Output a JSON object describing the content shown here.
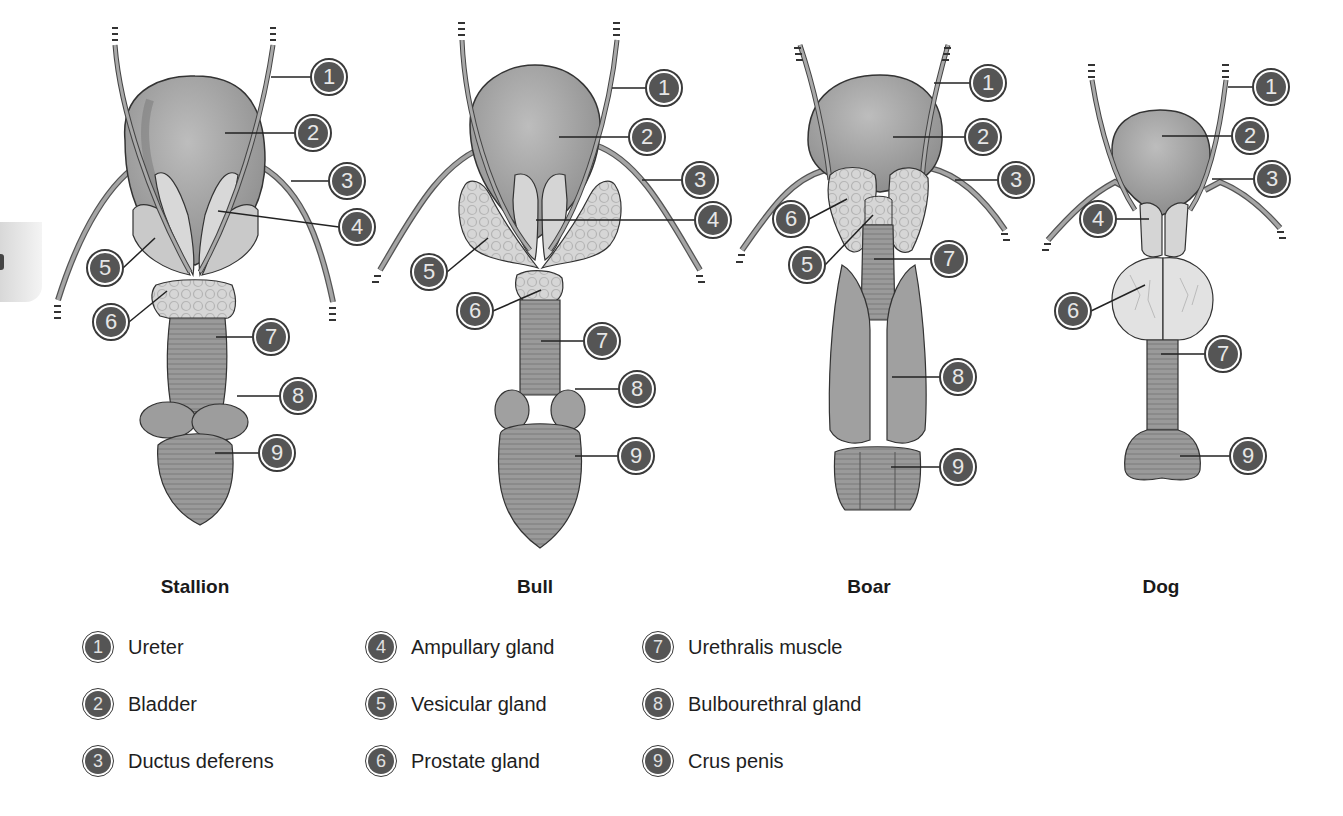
{
  "figure": {
    "species": [
      {
        "name": "Stallion",
        "x": 195
      },
      {
        "name": "Bull",
        "x": 535
      },
      {
        "name": "Boar",
        "x": 869
      },
      {
        "name": "Dog",
        "x": 1161
      }
    ]
  },
  "legend": [
    {
      "number": "1",
      "label": "Ureter"
    },
    {
      "number": "2",
      "label": "Bladder"
    },
    {
      "number": "3",
      "label": "Ductus deferens"
    },
    {
      "number": "4",
      "label": "Ampullary gland"
    },
    {
      "number": "5",
      "label": "Vesicular gland"
    },
    {
      "number": "6",
      "label": "Prostate gland"
    },
    {
      "number": "7",
      "label": "Urethralis muscle"
    },
    {
      "number": "8",
      "label": "Bulbourethral gland"
    },
    {
      "number": "9",
      "label": "Crus penis"
    }
  ],
  "callouts": {
    "stallion": [
      {
        "n": "1",
        "x": 329,
        "y": 77,
        "lx1": 271,
        "ly1": 77
      },
      {
        "n": "2",
        "x": 313,
        "y": 133,
        "lx1": 225,
        "ly1": 133
      },
      {
        "n": "3",
        "x": 347,
        "y": 181,
        "lx1": 291,
        "ly1": 181
      },
      {
        "n": "4",
        "x": 357,
        "y": 227,
        "lx1": 218,
        "ly1": 211
      },
      {
        "n": "5",
        "x": 105,
        "y": 268,
        "lx1": 155,
        "ly1": 238
      },
      {
        "n": "6",
        "x": 111,
        "y": 322,
        "lx1": 167,
        "ly1": 291
      },
      {
        "n": "7",
        "x": 271,
        "y": 337,
        "lx1": 216,
        "ly1": 337
      },
      {
        "n": "8",
        "x": 298,
        "y": 396,
        "lx1": 237,
        "ly1": 396
      },
      {
        "n": "9",
        "x": 277,
        "y": 453,
        "lx1": 215,
        "ly1": 453
      }
    ],
    "bull": [
      {
        "n": "1",
        "x": 664,
        "y": 88,
        "lx1": 612,
        "ly1": 88
      },
      {
        "n": "2",
        "x": 647,
        "y": 137,
        "lx1": 559,
        "ly1": 137
      },
      {
        "n": "3",
        "x": 700,
        "y": 180,
        "lx1": 642,
        "ly1": 180
      },
      {
        "n": "4",
        "x": 713,
        "y": 220,
        "lx1": 536,
        "ly1": 220
      },
      {
        "n": "5",
        "x": 429,
        "y": 272,
        "lx1": 488,
        "ly1": 238
      },
      {
        "n": "6",
        "x": 475,
        "y": 311,
        "lx1": 541,
        "ly1": 290
      },
      {
        "n": "7",
        "x": 602,
        "y": 341,
        "lx1": 541,
        "ly1": 341
      },
      {
        "n": "8",
        "x": 637,
        "y": 389,
        "lx1": 575,
        "ly1": 389
      },
      {
        "n": "9",
        "x": 636,
        "y": 456,
        "lx1": 575,
        "ly1": 456
      }
    ],
    "boar": [
      {
        "n": "1",
        "x": 988,
        "y": 83,
        "lx1": 934,
        "ly1": 83
      },
      {
        "n": "2",
        "x": 983,
        "y": 137,
        "lx1": 893,
        "ly1": 137
      },
      {
        "n": "3",
        "x": 1016,
        "y": 180,
        "lx1": 955,
        "ly1": 180
      },
      {
        "n": "4",
        "x": 0,
        "y": 0,
        "hidden": true
      },
      {
        "n": "5",
        "x": 807,
        "y": 265,
        "lx1": 873,
        "ly1": 215
      },
      {
        "n": "6",
        "x": 791,
        "y": 219,
        "lx1": 847,
        "ly1": 199
      },
      {
        "n": "7",
        "x": 949,
        "y": 259,
        "lx1": 874,
        "ly1": 259
      },
      {
        "n": "8",
        "x": 958,
        "y": 377,
        "lx1": 892,
        "ly1": 377
      },
      {
        "n": "9",
        "x": 958,
        "y": 467,
        "lx1": 891,
        "ly1": 467
      }
    ],
    "dog": [
      {
        "n": "1",
        "x": 1271,
        "y": 87,
        "lx1": 1228,
        "ly1": 87
      },
      {
        "n": "2",
        "x": 1250,
        "y": 136,
        "lx1": 1162,
        "ly1": 136
      },
      {
        "n": "3",
        "x": 1272,
        "y": 179,
        "lx1": 1212,
        "ly1": 179
      },
      {
        "n": "5x",
        "hidden": true,
        "x": 0,
        "y": 0
      },
      {
        "n": "4",
        "x": 1098,
        "y": 219,
        "lx1": 1149,
        "ly1": 219
      },
      {
        "n": "6",
        "x": 1073,
        "y": 311,
        "lx1": 1145,
        "ly1": 285
      },
      {
        "n": "7",
        "x": 1223,
        "y": 354,
        "lx1": 1161,
        "ly1": 354
      },
      {
        "n": "9",
        "x": 1248,
        "y": 456,
        "lx1": 1180,
        "ly1": 456
      }
    ]
  }
}
